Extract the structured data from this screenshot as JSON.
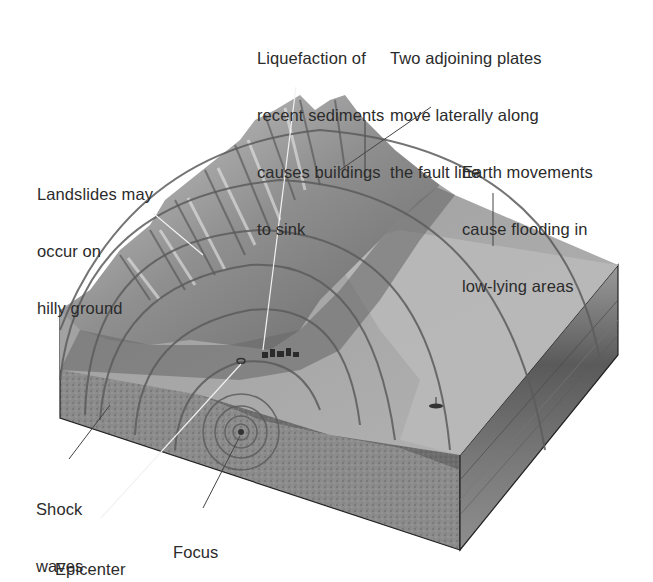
{
  "diagram": {
    "title": "",
    "type": "earthquake block diagram",
    "colors": {
      "background": "#ffffff",
      "label_text": "#2b2b2b",
      "leader_line": "#444444",
      "leader_line_light": "#f2f2f2",
      "mountain_light": "#d6d6d6",
      "mountain_dark": "#5a5a5a",
      "plain_surface": "#a9a9a9",
      "plain_surface_light": "#b8b8b8",
      "front_face_top": "#6e6e6e",
      "front_face_bottom": "#8a8a8a",
      "right_face": "#5f5f5f",
      "wave_line": "#5c5c5c"
    },
    "labels": [
      {
        "id": "liquefaction",
        "lines": [
          "Liquefaction of",
          "recent sediments",
          "causes buildings",
          "to sink"
        ]
      },
      {
        "id": "plates",
        "lines": [
          "Two adjoining plates",
          "move laterally along",
          "the fault line"
        ]
      },
      {
        "id": "flooding",
        "lines": [
          "Earth movements",
          "cause flooding in",
          "low-lying areas"
        ]
      },
      {
        "id": "landslides",
        "lines": [
          "Landslides may",
          "occur on",
          "hilly ground"
        ]
      },
      {
        "id": "shock-waves",
        "lines": [
          "Shock",
          "waves"
        ]
      },
      {
        "id": "epicenter",
        "lines": [
          "Epicenter"
        ]
      },
      {
        "id": "focus",
        "lines": [
          "Focus"
        ]
      }
    ]
  }
}
